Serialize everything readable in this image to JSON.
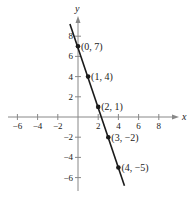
{
  "chart_data": {
    "type": "line",
    "title": "",
    "xlabel": "x",
    "ylabel": "y",
    "xlim": [
      -7,
      9.8
    ],
    "ylim": [
      -7.2,
      10
    ],
    "grid": false,
    "x_ticks": [
      -6,
      -4,
      -2,
      2,
      4,
      6,
      8
    ],
    "y_ticks": [
      -6,
      -4,
      -2,
      2,
      4,
      6,
      8
    ],
    "x_tick_labels": [
      "−6",
      "−4",
      "−2",
      "2",
      "4",
      "6",
      "8"
    ],
    "y_tick_labels": [
      "−6",
      "−4",
      "−2",
      "2",
      "4",
      "6",
      "8"
    ],
    "series": [
      {
        "name": "y = -3x + 7",
        "line_extent": [
          [
            -0.8,
            9.2
          ],
          [
            4.6,
            -6.8
          ]
        ],
        "points": [
          {
            "x": 0,
            "y": 7,
            "label": "(0, 7)"
          },
          {
            "x": 1,
            "y": 4,
            "label": "(1, 4)"
          },
          {
            "x": 2,
            "y": 1,
            "label": "(2, 1)"
          },
          {
            "x": 3,
            "y": -2,
            "label": "(3, −2)"
          },
          {
            "x": 4,
            "y": -5,
            "label": "(4, −5)"
          }
        ]
      }
    ],
    "colors": {
      "line": "#1a1a1a",
      "axis": "#888888"
    }
  }
}
